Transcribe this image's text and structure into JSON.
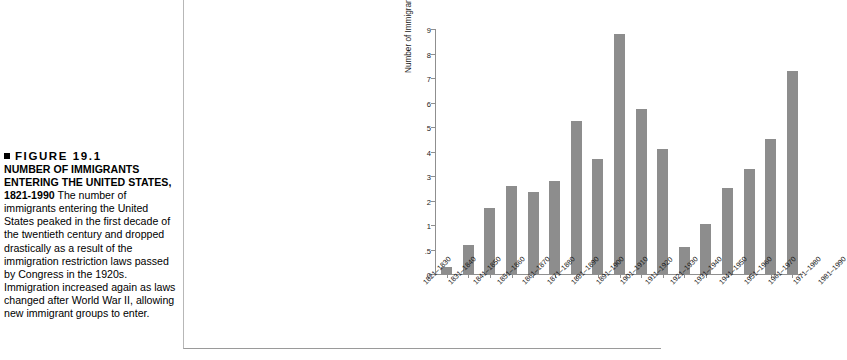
{
  "caption": {
    "bullet_icon": "black-square-bullet",
    "figure_label": "FIGURE 19.1",
    "heading": "NUMBER OF IMMIGRANTS ENTERING THE UNITED STATES, 1821-1990",
    "body": "  The number of immigrants entering the United States peaked in the first decade of the twentieth century and dropped drastically as a result of the immigration restriction laws passed by Congress in the 1920s. Immigration increased again as laws changed after World War II, allowing new immigrant groups to enter."
  },
  "chart_data": {
    "type": "bar",
    "title": "",
    "xlabel": "",
    "ylabel": "Number of Immigrants (millions)",
    "ylim": [
      0,
      9
    ],
    "grid": false,
    "legend": null,
    "bar_color": "#8d8d8d",
    "axis_color": "#8f8f8f",
    "ytick_labels": [
      "0",
      ".5",
      "1",
      "2",
      "3",
      "4",
      "5",
      "6",
      "7",
      "8",
      "9"
    ],
    "ytick_values": [
      0,
      0.5,
      1,
      2,
      3,
      4,
      5,
      6,
      7,
      8,
      9
    ],
    "categories": [
      "1821–1830",
      "1831–1840",
      "1841–1850",
      "1851–1860",
      "1861–1870",
      "1871–1880",
      "1881–1890",
      "1891–1900",
      "1901–1910",
      "1911–1920",
      "1921–1930",
      "1931–1940",
      "1941–1950",
      "1951–1960",
      "1961–1970",
      "1971–1980",
      "1981–1990"
    ],
    "values": [
      0.15,
      0.6,
      1.7,
      2.6,
      2.35,
      2.8,
      5.25,
      3.7,
      8.8,
      5.75,
      4.1,
      0.55,
      1.05,
      2.5,
      3.3,
      4.5,
      7.3
    ]
  }
}
